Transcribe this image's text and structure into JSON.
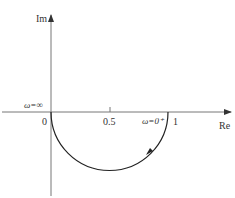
{
  "diagram": {
    "type": "nyquist-plot",
    "axes": {
      "x_label": "Re",
      "y_label": "Im",
      "origin_label": "0"
    },
    "ticks": [
      {
        "label": "0.5",
        "value": 0.5
      },
      {
        "label": "1",
        "value": 1
      }
    ],
    "annotations": {
      "omega_infinity": "ω=∞",
      "omega_zero": "ω=0⁺"
    },
    "curve": {
      "shape": "lower-semicircle",
      "from": [
        0,
        0
      ],
      "to": [
        1,
        0
      ],
      "center": [
        0.5,
        0
      ],
      "radius": 0.5,
      "direction": "from ω=0⁺ at (1,0) toward ω=∞ at origin, clockwise through lower half-plane"
    },
    "colors": {
      "axis": "#777777",
      "curve": "#222222",
      "text": "#333333"
    }
  }
}
